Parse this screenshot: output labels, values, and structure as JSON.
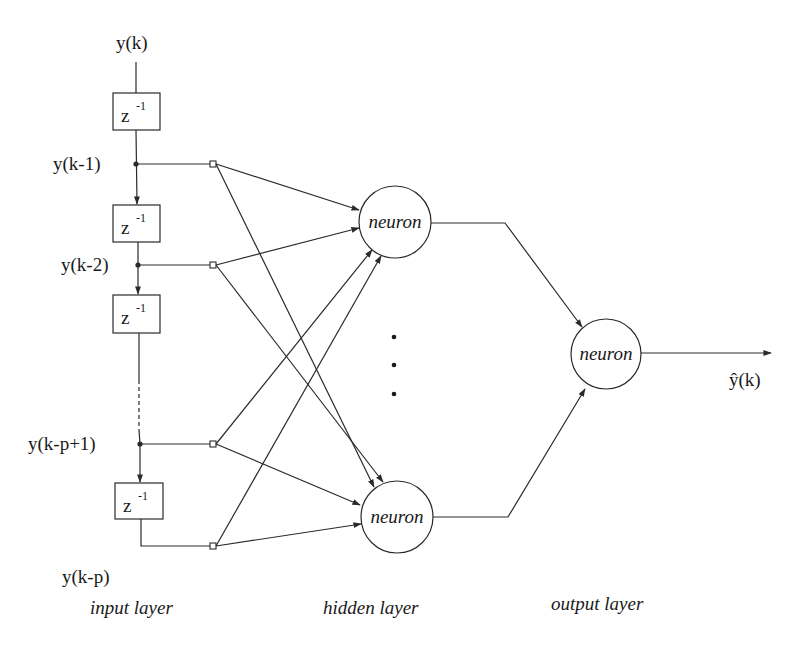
{
  "diagram": {
    "type": "neural-network-autoregressive-predictor",
    "input": {
      "signal_label": "y(k)",
      "delay_label": "z",
      "delay_exponent": "-1",
      "taps": [
        {
          "label": "y(k-1)"
        },
        {
          "label": "y(k-2)"
        },
        {
          "label": "y(k-p+1)"
        },
        {
          "label": "y(k-p)"
        }
      ]
    },
    "hidden": {
      "neurons": [
        {
          "label": "neuron"
        },
        {
          "label": "neuron"
        }
      ],
      "ellipsis": "⋮"
    },
    "output": {
      "neuron_label": "neuron",
      "output_label": "ŷ(k)"
    },
    "layers": [
      {
        "label": "input layer"
      },
      {
        "label": "hidden layer"
      },
      {
        "label": "output layer"
      }
    ],
    "colors": {
      "line": "#2a2a2a",
      "text": "#1a1a1a",
      "background": "#ffffff"
    }
  }
}
